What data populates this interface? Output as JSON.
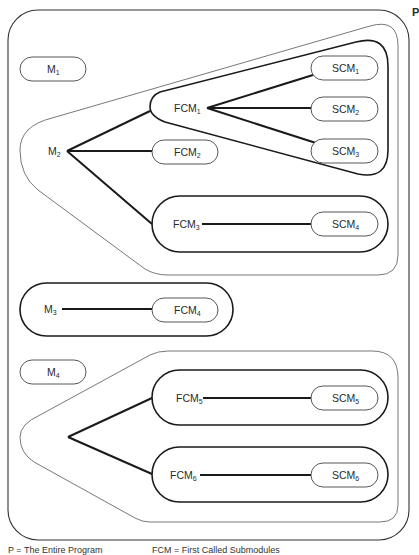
{
  "diagram": {
    "program_label": "P",
    "nodes": {
      "M1": {
        "base": "M",
        "sub": "1"
      },
      "M2": {
        "base": "M",
        "sub": "2"
      },
      "M3": {
        "base": "M",
        "sub": "3"
      },
      "M4": {
        "base": "M",
        "sub": "4"
      },
      "FCM1": {
        "base": "FCM",
        "sub": "1"
      },
      "FCM2": {
        "base": "FCM",
        "sub": "2"
      },
      "FCM3": {
        "base": "FCM",
        "sub": "3"
      },
      "FCM4": {
        "base": "FCM",
        "sub": "4"
      },
      "FCM5": {
        "base": "FCM",
        "sub": "5"
      },
      "FCM6": {
        "base": "FCM",
        "sub": "6"
      },
      "SCM1": {
        "base": "SCM",
        "sub": "1"
      },
      "SCM2": {
        "base": "SCM",
        "sub": "2"
      },
      "SCM3": {
        "base": "SCM",
        "sub": "3"
      },
      "SCM4": {
        "base": "SCM",
        "sub": "4"
      },
      "SCM5": {
        "base": "SCM",
        "sub": "5"
      },
      "SCM6": {
        "base": "SCM",
        "sub": "6"
      }
    },
    "edges": [
      [
        "M2",
        "FCM1"
      ],
      [
        "M2",
        "FCM2"
      ],
      [
        "M2",
        "FCM3"
      ],
      [
        "FCM1",
        "SCM1"
      ],
      [
        "FCM1",
        "SCM2"
      ],
      [
        "FCM1",
        "SCM3"
      ],
      [
        "FCM3",
        "SCM4"
      ],
      [
        "M3",
        "FCM4"
      ],
      [
        "M4",
        "FCM5"
      ],
      [
        "M4",
        "FCM6"
      ],
      [
        "FCM5",
        "SCM5"
      ],
      [
        "FCM6",
        "SCM6"
      ]
    ]
  },
  "legend": {
    "p": "P = The Entire Program",
    "fcm": "FCM = First Called Submodules"
  }
}
